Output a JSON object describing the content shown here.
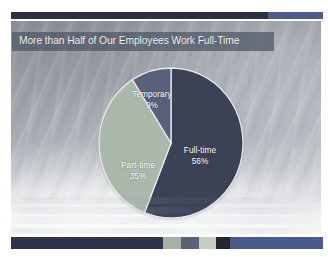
{
  "slide": {
    "title": "More than Half of Our Employees Work Full-Time"
  },
  "theme": {
    "accent_dark": "#2b2f44",
    "accent_blue": "#4d5b91",
    "title_band": "#4e5664",
    "title_text_color": "#f2f4f6",
    "bottom_segments": [
      "#30344a",
      "#a4b2a5",
      "#5c6078",
      "#c3cfc3",
      "#26252c",
      "#4a5a8e"
    ]
  },
  "chart_data": {
    "type": "pie",
    "title": "More than Half of Our Employees Work Full-Time",
    "xlabel": "",
    "ylabel": "",
    "categories": [
      "Full-time",
      "Part-time",
      "Temporary"
    ],
    "values": [
      56,
      35,
      9
    ],
    "value_labels": [
      "56%",
      "35%",
      "9%"
    ],
    "units": "percent",
    "colors": [
      "#3c4256",
      "#a9b8a9",
      "#59607a"
    ],
    "start_angle_deg": 0,
    "direction": "clockwise",
    "legend": "none",
    "data_labels": "inside",
    "grid": false,
    "slices": [
      {
        "label": "Full-time",
        "value": 56,
        "display": "56%",
        "color": "#3c4256",
        "start_deg": 0.0,
        "end_deg": 201.6
      },
      {
        "label": "Part-time",
        "value": 35,
        "display": "35%",
        "color": "#a9b8a9",
        "start_deg": 201.6,
        "end_deg": 327.6
      },
      {
        "label": "Temporary",
        "value": 9,
        "display": "9%",
        "color": "#59607a",
        "start_deg": 327.6,
        "end_deg": 360.0
      }
    ]
  }
}
